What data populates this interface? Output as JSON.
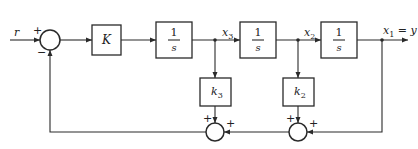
{
  "diagram": {
    "type": "block-diagram",
    "input_label": "r",
    "output_label": "x₁ = y",
    "output_var": "x",
    "output_sub": "1",
    "output_eq": " = y",
    "blocks": [
      {
        "id": "gain-K",
        "label": "K"
      },
      {
        "id": "integrator-1",
        "num": "1",
        "den": "s"
      },
      {
        "id": "integrator-2",
        "num": "1",
        "den": "s"
      },
      {
        "id": "integrator-3",
        "num": "1",
        "den": "s"
      },
      {
        "id": "gain-k3",
        "var": "k",
        "sub": "3"
      },
      {
        "id": "gain-k2",
        "var": "k",
        "sub": "2"
      }
    ],
    "signals": [
      {
        "id": "x3",
        "var": "x",
        "sub": "3"
      },
      {
        "id": "x2",
        "var": "x",
        "sub": "2"
      },
      {
        "id": "x1",
        "var": "x",
        "sub": "1"
      }
    ],
    "summing_junctions": [
      {
        "id": "sum-main",
        "signs": {
          "left": "+",
          "bottom": "−"
        }
      },
      {
        "id": "sum-k3",
        "signs": {
          "top": "+",
          "right": "+"
        }
      },
      {
        "id": "sum-k2",
        "signs": {
          "top": "+",
          "right": "+"
        }
      }
    ]
  }
}
